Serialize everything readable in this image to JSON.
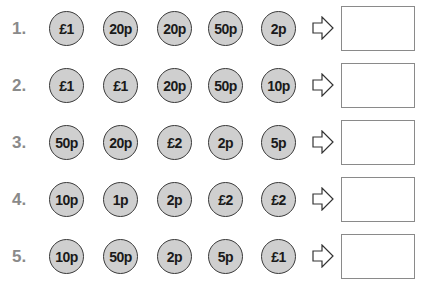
{
  "rows": [
    {
      "label": "1.",
      "coins": [
        "£1",
        "20p",
        "20p",
        "50p",
        "2p"
      ],
      "answer": ""
    },
    {
      "label": "2.",
      "coins": [
        "£1",
        "£1",
        "20p",
        "50p",
        "10p"
      ],
      "answer": ""
    },
    {
      "label": "3.",
      "coins": [
        "50p",
        "20p",
        "£2",
        "2p",
        "5p"
      ],
      "answer": ""
    },
    {
      "label": "4.",
      "coins": [
        "10p",
        "1p",
        "2p",
        "£2",
        "£2"
      ],
      "answer": ""
    },
    {
      "label": "5.",
      "coins": [
        "10p",
        "50p",
        "2p",
        "5p",
        "£1"
      ],
      "answer": ""
    }
  ],
  "icons": {
    "arrow": "right-arrow-outline-icon"
  },
  "colors": {
    "coin_fill": "#cfcfcf",
    "coin_border": "#3a3a3a",
    "number": "#8a8a8a",
    "box_border": "#8a8a8a"
  }
}
